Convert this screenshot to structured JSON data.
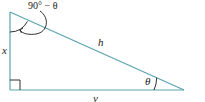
{
  "diagram": {
    "type": "right-triangle",
    "colors": {
      "line": "#5ba3b0",
      "arc": "#1a1a1a",
      "text": "#1a1a1a"
    },
    "labels": {
      "top_angle": "90° − θ",
      "hypotenuse": "h",
      "vertical_side": "x",
      "horizontal_side": "y",
      "bottom_angle": "θ"
    }
  }
}
